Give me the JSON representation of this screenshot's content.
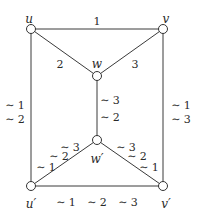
{
  "diagram": {
    "type": "graph",
    "nodes": [
      {
        "id": "u",
        "label": "u",
        "x": 31,
        "y": 29,
        "label_x": 29,
        "label_y": 19
      },
      {
        "id": "v",
        "label": "v",
        "x": 163,
        "y": 29,
        "label_x": 166,
        "label_y": 19
      },
      {
        "id": "w",
        "label": "w",
        "x": 97,
        "y": 76,
        "label_x": 97,
        "label_y": 64
      },
      {
        "id": "w_prime",
        "label": "w′",
        "x": 97,
        "y": 140,
        "label_x": 97,
        "label_y": 159
      },
      {
        "id": "u_prime",
        "label": "u′",
        "x": 31,
        "y": 186,
        "label_x": 31,
        "label_y": 204
      },
      {
        "id": "v_prime",
        "label": "v′",
        "x": 163,
        "y": 186,
        "label_x": 166,
        "label_y": 204
      }
    ],
    "edges": [
      {
        "id": "u-v",
        "from": "u",
        "to": "v",
        "labels": [
          {
            "text": "1",
            "x": 97,
            "y": 22
          }
        ]
      },
      {
        "id": "u-w",
        "from": "u",
        "to": "w",
        "labels": [
          {
            "text": "2",
            "x": 60,
            "y": 65
          }
        ]
      },
      {
        "id": "v-w",
        "from": "v",
        "to": "w",
        "labels": [
          {
            "text": "3",
            "x": 135,
            "y": 65
          }
        ]
      },
      {
        "id": "w-w_prime",
        "from": "w",
        "to": "w_prime",
        "labels": [
          {
            "text": "∼ 3",
            "x": 110,
            "y": 101
          },
          {
            "text": "∼ 2",
            "x": 110,
            "y": 118
          }
        ]
      },
      {
        "id": "u-u_prime",
        "from": "u",
        "to": "u_prime",
        "labels": [
          {
            "text": "∼ 1",
            "x": 15,
            "y": 106
          },
          {
            "text": "∼ 2",
            "x": 15,
            "y": 120
          }
        ]
      },
      {
        "id": "v-v_prime",
        "from": "v",
        "to": "v_prime",
        "labels": [
          {
            "text": "∼ 1",
            "x": 181,
            "y": 106
          },
          {
            "text": "∼ 3",
            "x": 181,
            "y": 120
          }
        ]
      },
      {
        "id": "u_prime-w_prime",
        "from": "u_prime",
        "to": "w_prime",
        "labels": [
          {
            "text": "∼ 3",
            "x": 70,
            "y": 148
          },
          {
            "text": "∼ 2",
            "x": 59,
            "y": 157
          },
          {
            "text": "∼ 1",
            "x": 46,
            "y": 168
          }
        ]
      },
      {
        "id": "v_prime-w_prime",
        "from": "v_prime",
        "to": "w_prime",
        "labels": [
          {
            "text": "∼ 3",
            "x": 126,
            "y": 148
          },
          {
            "text": "∼ 2",
            "x": 137,
            "y": 157
          },
          {
            "text": "∼ 1",
            "x": 149,
            "y": 168
          }
        ]
      },
      {
        "id": "u_prime-v_prime",
        "from": "u_prime",
        "to": "v_prime",
        "labels": [
          {
            "text": "∼ 1",
            "x": 66,
            "y": 203
          },
          {
            "text": "∼ 2",
            "x": 97,
            "y": 203
          },
          {
            "text": "∼ 3",
            "x": 128,
            "y": 203
          }
        ]
      }
    ],
    "style": {
      "edge_color": "#3a3a3a",
      "node_stroke": "#333333",
      "node_fill": "#ffffff",
      "node_radius": 4.5,
      "text_color": "#2a2a2a"
    }
  }
}
